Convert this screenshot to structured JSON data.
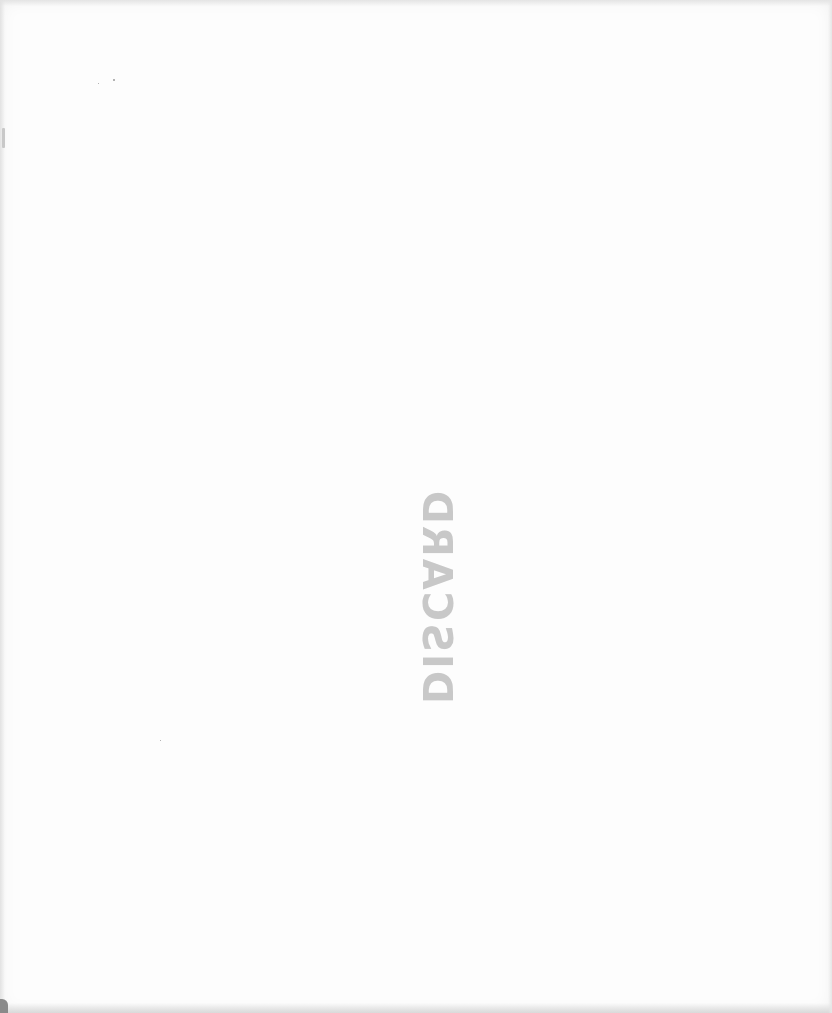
{
  "page": {
    "type": "scanned-blank-page",
    "background_color": "#fdfdfd"
  },
  "stamp": {
    "text": "DISCARD",
    "orientation": "rotated-90-mirrored",
    "color": "#9e9e9e"
  }
}
